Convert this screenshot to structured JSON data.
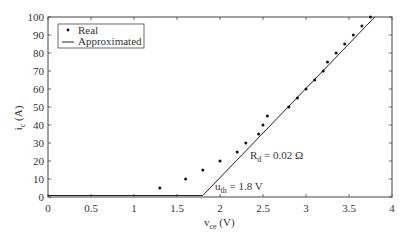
{
  "chart_data": {
    "type": "scatter",
    "title": "",
    "xlabel": "v_ce (V)",
    "ylabel": "i_c (A)",
    "xlim": [
      0,
      4
    ],
    "ylim": [
      0,
      100
    ],
    "x_ticks": [
      0,
      0.5,
      1,
      1.5,
      2,
      2.5,
      3,
      3.5,
      4
    ],
    "x_tick_labels": [
      "0",
      "0.5",
      "1",
      "1.5",
      "2",
      "2.5",
      "3",
      "3.5",
      "4"
    ],
    "y_ticks": [
      0,
      10,
      20,
      30,
      40,
      50,
      60,
      70,
      80,
      90,
      100
    ],
    "y_tick_labels": [
      "0",
      "10",
      "20",
      "30",
      "40",
      "50",
      "60",
      "70",
      "80",
      "90",
      "100"
    ],
    "grid": false,
    "legend_position": "upper left",
    "series": [
      {
        "name": "Real",
        "style": "dots",
        "x": [
          1.3,
          1.6,
          1.8,
          2.0,
          2.2,
          2.3,
          2.45,
          2.5,
          2.55,
          2.8,
          2.9,
          3.0,
          3.1,
          3.2,
          3.25,
          3.35,
          3.45,
          3.55,
          3.65,
          3.75
        ],
        "y": [
          5,
          10,
          15,
          20,
          25,
          30,
          35,
          40,
          45,
          50,
          55,
          60,
          65,
          70,
          75,
          80,
          85,
          90,
          95,
          100
        ]
      },
      {
        "name": "Approximated",
        "style": "line",
        "x": [
          0,
          1.8,
          3.8
        ],
        "y": [
          0,
          0,
          100
        ]
      }
    ],
    "annotations": [
      {
        "text_main": "R",
        "text_sub": "d",
        "text_rest": " = 0.02 Ω",
        "x": 2.6,
        "y": 32
      },
      {
        "text_main": "u",
        "text_sub": "th",
        "text_rest": " = 1.8 V",
        "x": 1.93,
        "y": 3
      }
    ]
  },
  "labels": {
    "xlabel_main": "v",
    "xlabel_sub": "ce",
    "xlabel_rest": " (V)",
    "ylabel_main": "i",
    "ylabel_sub": "c",
    "ylabel_rest": " (A)",
    "legend_real": "Real",
    "legend_approx": "Approximated",
    "ann_rd_main": "R",
    "ann_rd_sub": "d",
    "ann_rd_rest": " = 0.02 Ω",
    "ann_uth_main": "u",
    "ann_uth_sub": "th",
    "ann_uth_rest": " = 1.8 V"
  }
}
